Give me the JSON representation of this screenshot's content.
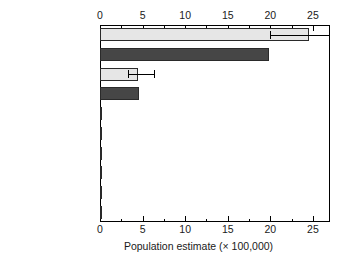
{
  "chart_data": {
    "type": "bar",
    "orientation": "horizontal",
    "title": "",
    "xlabel": "Population estimate (× 100,000)",
    "ylabel": "",
    "xlim": [
      0,
      27
    ],
    "xticks": [
      0,
      5,
      10,
      15,
      20,
      25
    ],
    "xtick_labels": [
      "0",
      "5",
      "10",
      "15",
      "20",
      "25"
    ],
    "xminor_step": 2.5,
    "grid": false,
    "legend": "none",
    "axis_positions": [
      "top",
      "bottom"
    ],
    "categories": [
      "ICELAND",
      "NORWAY",
      "FAEROE ISLANDS",
      "UNITED KINGDOM",
      "REP. OF IRELAND",
      "SVALBARD",
      "FRANCE",
      "GUERNSEY",
      "ISLE OF MAN",
      "JERSEY"
    ],
    "values": [
      24.5,
      19.8,
      4.5,
      4.6,
      0.25,
      0.12,
      0.1,
      0.1,
      0.1,
      0.1
    ],
    "bar_shades": [
      "light",
      "dark",
      "light",
      "dark",
      "dark",
      "dark",
      "dark",
      "dark",
      "dark",
      "dark"
    ],
    "error_bars": [
      {
        "category": "ICELAND",
        "low": 20.0,
        "high": 27.0,
        "clipped_high": true
      },
      {
        "category": "FAEROE ISLANDS",
        "low": 3.3,
        "high": 6.3,
        "clipped_high": false
      }
    ],
    "colors": {
      "bar_light": "#e6e6e6",
      "bar_dark": "#464646",
      "bar_edge": "#2a2a2a",
      "axis": "#000000",
      "text": "#1a1a1a",
      "background": "#ffffff"
    }
  }
}
